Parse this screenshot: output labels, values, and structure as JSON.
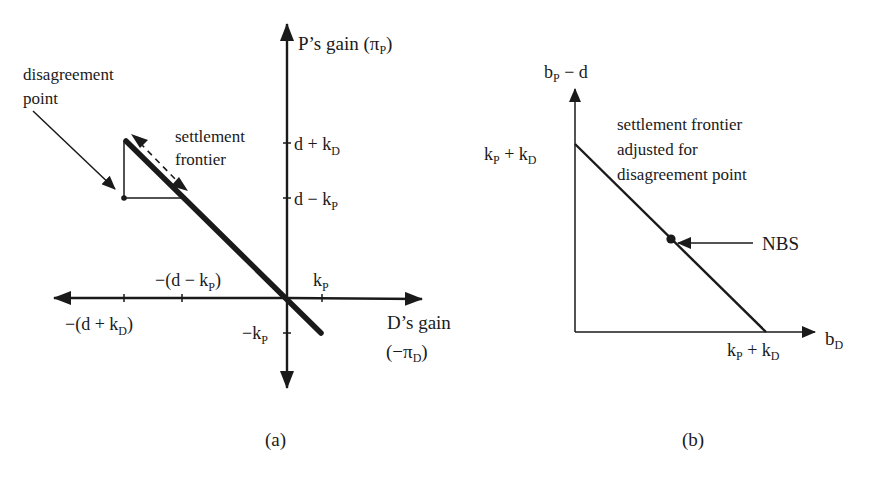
{
  "panel_a": {
    "caption": "(a)",
    "y_axis_label": "P’s gain (",
    "y_axis_label_sym": "π",
    "y_axis_label_sub": "P",
    "y_axis_label_close": ")",
    "x_axis_label_line1": "D’s gain",
    "x_axis_label_line2_open": "(−",
    "x_axis_label_line2_sym": "π",
    "x_axis_label_line2_sub": "D",
    "x_axis_label_line2_close": ")",
    "disagreement_label_line1": "disagreement",
    "disagreement_label_line2": "point",
    "frontier_label_line1": "settlement",
    "frontier_label_line2": "frontier",
    "y_ticks": [
      {
        "main": "d + k",
        "sub": "D"
      },
      {
        "main": "d − k",
        "sub": "P"
      },
      {
        "main": "−k",
        "sub": "P"
      }
    ],
    "x_ticks": [
      {
        "main": "−(d + k",
        "sub": "D",
        "close": ")"
      },
      {
        "main": "−(d − k",
        "sub": "P",
        "close": ")"
      },
      {
        "main": "k",
        "sub": "P",
        "close": ""
      }
    ]
  },
  "panel_b": {
    "caption": "(b)",
    "y_axis_label_main": "b",
    "y_axis_label_sub": "P",
    "y_axis_label_rest": " − d",
    "x_axis_label_main": "b",
    "x_axis_label_sub": "D",
    "y_intercept": {
      "k1": "k",
      "s1": "P",
      "mid": " + k",
      "s2": "D"
    },
    "x_intercept": {
      "k1": "k",
      "s1": "P",
      "mid": " + k",
      "s2": "D"
    },
    "frontier_label_line1": "settlement frontier",
    "frontier_label_line2": "adjusted for",
    "frontier_label_line3": "disagreement point",
    "nbs_label": "NBS"
  },
  "colors": {
    "ink": "#1a1a1a",
    "background": "#ffffff"
  }
}
